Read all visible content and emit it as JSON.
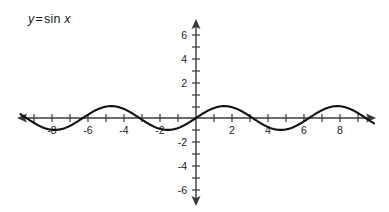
{
  "figure": {
    "equation_label": {
      "y": "y",
      "equals": "=",
      "function": "sin",
      "x": "x"
    },
    "curve_color": "#111111",
    "axis_color": "#3a3a3a",
    "background": "#ffffff"
  },
  "chart_data": {
    "type": "line",
    "xlabel": "",
    "ylabel": "",
    "xlim": [
      -10.0,
      10.0
    ],
    "ylim": [
      -7.0,
      7.0
    ],
    "grid": false,
    "legend": "none",
    "x_tick_labels": [
      "-8",
      "-6",
      "-4",
      "-2",
      "2",
      "4",
      "6",
      "8"
    ],
    "x_tick_values": [
      -8,
      -6,
      -4,
      -2,
      2,
      4,
      6,
      8
    ],
    "x_minor_tick_interval": 1,
    "y_tick_labels": [
      "6",
      "4",
      "2",
      "-2",
      "-4",
      "-6"
    ],
    "y_tick_values": [
      6,
      4,
      2,
      -2,
      -4,
      -6
    ],
    "y_minor_tick_interval": 1,
    "axes_arrows": [
      "left",
      "right",
      "up",
      "down"
    ],
    "series": [
      {
        "name": "y = sin x",
        "expression": "sin(x)",
        "amplitude": 1,
        "period": 6.283185,
        "x": [
          -10.0,
          -9.5,
          -9.0,
          -8.5,
          -8.0,
          -7.5,
          -7.0,
          -6.5,
          -6.0,
          -5.5,
          -5.0,
          -4.5,
          -4.0,
          -3.5,
          -3.0,
          -2.5,
          -2.0,
          -1.5,
          -1.0,
          -0.5,
          0.0,
          0.5,
          1.0,
          1.5,
          2.0,
          2.5,
          3.0,
          3.5,
          4.0,
          4.5,
          5.0,
          5.5,
          6.0,
          6.5,
          7.0,
          7.5,
          8.0,
          8.5,
          9.0,
          9.5,
          10.0
        ],
        "values": [
          0.544,
          0.075,
          -0.412,
          -0.798,
          -0.989,
          -0.938,
          -0.657,
          -0.215,
          0.279,
          0.706,
          0.959,
          0.978,
          0.757,
          0.351,
          -0.141,
          -0.599,
          -0.909,
          -0.997,
          -0.841,
          -0.479,
          0.0,
          0.479,
          0.841,
          0.997,
          0.909,
          0.599,
          0.141,
          -0.351,
          -0.757,
          -0.978,
          -0.959,
          -0.706,
          -0.279,
          0.215,
          0.657,
          0.938,
          0.989,
          0.798,
          0.412,
          -0.075,
          -0.544
        ]
      }
    ],
    "key_points": {
      "maxima_x": [
        -7.854,
        -1.571,
        4.712
      ],
      "minima_x": [
        -4.712,
        1.571,
        7.854
      ],
      "zeros_x": [
        -9.425,
        -6.283,
        -3.142,
        0.0,
        3.142,
        6.283,
        9.425
      ]
    }
  }
}
